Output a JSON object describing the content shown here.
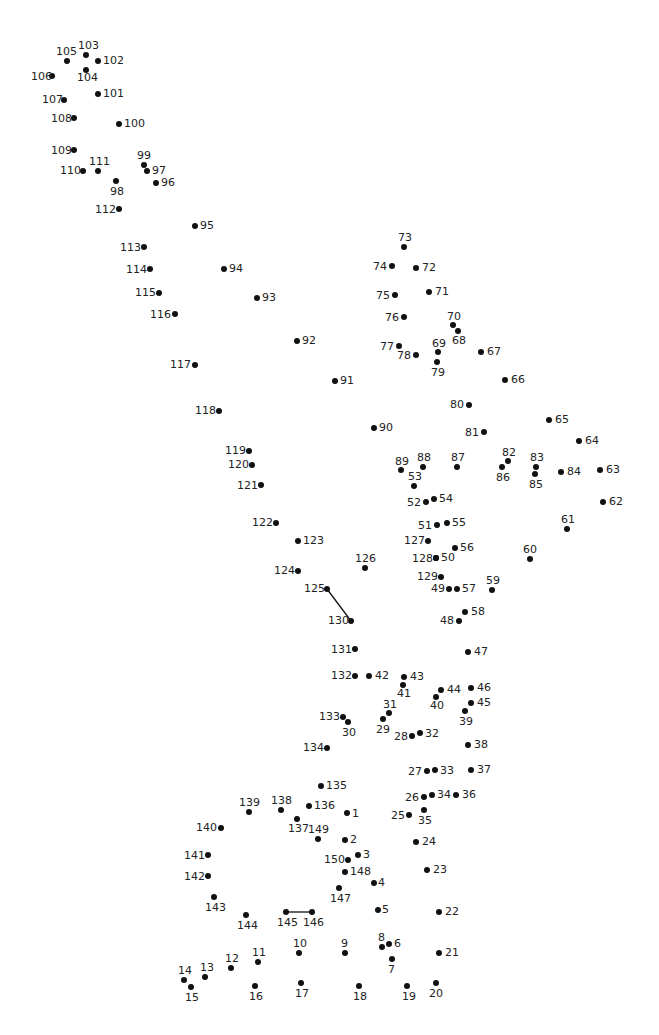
{
  "puzzle": {
    "type": "connect-the-dots",
    "total_dots": 150,
    "colors": {
      "dot": "#111111",
      "label": "#222222",
      "background": "#ffffff"
    },
    "drawn_segments": [
      {
        "from": 125,
        "to": 130
      },
      {
        "from": 145,
        "to": 146
      }
    ],
    "dots": [
      {
        "n": 1,
        "x": 347,
        "y": 813,
        "lx": 352,
        "ly": 808
      },
      {
        "n": 2,
        "x": 345,
        "y": 840,
        "lx": 350,
        "ly": 834
      },
      {
        "n": 3,
        "x": 358,
        "y": 855,
        "lx": 363,
        "ly": 849
      },
      {
        "n": 4,
        "x": 374,
        "y": 883,
        "lx": 378,
        "ly": 877
      },
      {
        "n": 5,
        "x": 378,
        "y": 910,
        "lx": 382,
        "ly": 904
      },
      {
        "n": 6,
        "x": 389,
        "y": 944,
        "lx": 394,
        "ly": 938
      },
      {
        "n": 7,
        "x": 392,
        "y": 959,
        "lx": 388,
        "ly": 964
      },
      {
        "n": 8,
        "x": 382,
        "y": 947,
        "lx": 378,
        "ly": 932
      },
      {
        "n": 9,
        "x": 345,
        "y": 953,
        "lx": 341,
        "ly": 938
      },
      {
        "n": 10,
        "x": 299,
        "y": 953,
        "lx": 293,
        "ly": 938
      },
      {
        "n": 11,
        "x": 258,
        "y": 962,
        "lx": 252,
        "ly": 947
      },
      {
        "n": 12,
        "x": 231,
        "y": 968,
        "lx": 225,
        "ly": 953
      },
      {
        "n": 13,
        "x": 205,
        "y": 977,
        "lx": 200,
        "ly": 962
      },
      {
        "n": 14,
        "x": 184,
        "y": 980,
        "lx": 178,
        "ly": 965
      },
      {
        "n": 15,
        "x": 191,
        "y": 987,
        "lx": 185,
        "ly": 992
      },
      {
        "n": 16,
        "x": 255,
        "y": 986,
        "lx": 249,
        "ly": 991
      },
      {
        "n": 17,
        "x": 301,
        "y": 983,
        "lx": 295,
        "ly": 988
      },
      {
        "n": 18,
        "x": 359,
        "y": 986,
        "lx": 353,
        "ly": 991
      },
      {
        "n": 19,
        "x": 407,
        "y": 986,
        "lx": 402,
        "ly": 991
      },
      {
        "n": 20,
        "x": 436,
        "y": 983,
        "lx": 429,
        "ly": 988
      },
      {
        "n": 21,
        "x": 439,
        "y": 953,
        "lx": 445,
        "ly": 947
      },
      {
        "n": 22,
        "x": 439,
        "y": 912,
        "lx": 445,
        "ly": 906
      },
      {
        "n": 23,
        "x": 427,
        "y": 870,
        "lx": 433,
        "ly": 864
      },
      {
        "n": 24,
        "x": 416,
        "y": 842,
        "lx": 422,
        "ly": 836
      },
      {
        "n": 25,
        "x": 409,
        "y": 815,
        "lx": 391,
        "ly": 810
      },
      {
        "n": 26,
        "x": 424,
        "y": 797,
        "lx": 405,
        "ly": 792
      },
      {
        "n": 27,
        "x": 427,
        "y": 771,
        "lx": 408,
        "ly": 766
      },
      {
        "n": 28,
        "x": 412,
        "y": 736,
        "lx": 394,
        "ly": 731
      },
      {
        "n": 29,
        "x": 383,
        "y": 719,
        "lx": 376,
        "ly": 724
      },
      {
        "n": 30,
        "x": 348,
        "y": 722,
        "lx": 342,
        "ly": 727
      },
      {
        "n": 31,
        "x": 389,
        "y": 713,
        "lx": 383,
        "ly": 699
      },
      {
        "n": 32,
        "x": 420,
        "y": 733,
        "lx": 425,
        "ly": 728
      },
      {
        "n": 33,
        "x": 435,
        "y": 770,
        "lx": 440,
        "ly": 765
      },
      {
        "n": 34,
        "x": 432,
        "y": 795,
        "lx": 437,
        "ly": 789
      },
      {
        "n": 35,
        "x": 424,
        "y": 810,
        "lx": 418,
        "ly": 815
      },
      {
        "n": 36,
        "x": 456,
        "y": 795,
        "lx": 462,
        "ly": 789
      },
      {
        "n": 37,
        "x": 471,
        "y": 770,
        "lx": 477,
        "ly": 764
      },
      {
        "n": 38,
        "x": 468,
        "y": 745,
        "lx": 474,
        "ly": 739
      },
      {
        "n": 39,
        "x": 465,
        "y": 711,
        "lx": 459,
        "ly": 716
      },
      {
        "n": 40,
        "x": 436,
        "y": 697,
        "lx": 430,
        "ly": 700
      },
      {
        "n": 41,
        "x": 403,
        "y": 685,
        "lx": 397,
        "ly": 688
      },
      {
        "n": 42,
        "x": 369,
        "y": 676,
        "lx": 375,
        "ly": 670
      },
      {
        "n": 43,
        "x": 404,
        "y": 677,
        "lx": 410,
        "ly": 671
      },
      {
        "n": 44,
        "x": 441,
        "y": 690,
        "lx": 447,
        "ly": 684
      },
      {
        "n": 45,
        "x": 471,
        "y": 703,
        "lx": 477,
        "ly": 697
      },
      {
        "n": 46,
        "x": 471,
        "y": 688,
        "lx": 477,
        "ly": 682
      },
      {
        "n": 47,
        "x": 468,
        "y": 652,
        "lx": 474,
        "ly": 646
      },
      {
        "n": 48,
        "x": 459,
        "y": 621,
        "lx": 440,
        "ly": 615
      },
      {
        "n": 49,
        "x": 449,
        "y": 589,
        "lx": 431,
        "ly": 583
      },
      {
        "n": 50,
        "x": 436,
        "y": 558,
        "lx": 441,
        "ly": 552
      },
      {
        "n": 51,
        "x": 437,
        "y": 525,
        "lx": 418,
        "ly": 520
      },
      {
        "n": 52,
        "x": 426,
        "y": 502,
        "lx": 407,
        "ly": 497
      },
      {
        "n": 53,
        "x": 414,
        "y": 486,
        "lx": 408,
        "ly": 471
      },
      {
        "n": 54,
        "x": 434,
        "y": 499,
        "lx": 439,
        "ly": 493
      },
      {
        "n": 55,
        "x": 447,
        "y": 523,
        "lx": 452,
        "ly": 517
      },
      {
        "n": 56,
        "x": 455,
        "y": 548,
        "lx": 460,
        "ly": 542
      },
      {
        "n": 57,
        "x": 457,
        "y": 589,
        "lx": 462,
        "ly": 583
      },
      {
        "n": 58,
        "x": 465,
        "y": 612,
        "lx": 471,
        "ly": 606
      },
      {
        "n": 59,
        "x": 492,
        "y": 590,
        "lx": 486,
        "ly": 575
      },
      {
        "n": 60,
        "x": 530,
        "y": 559,
        "lx": 523,
        "ly": 544
      },
      {
        "n": 61,
        "x": 567,
        "y": 529,
        "lx": 561,
        "ly": 514
      },
      {
        "n": 62,
        "x": 603,
        "y": 502,
        "lx": 609,
        "ly": 496
      },
      {
        "n": 63,
        "x": 600,
        "y": 470,
        "lx": 606,
        "ly": 464
      },
      {
        "n": 64,
        "x": 579,
        "y": 441,
        "lx": 585,
        "ly": 435
      },
      {
        "n": 65,
        "x": 549,
        "y": 420,
        "lx": 555,
        "ly": 414
      },
      {
        "n": 66,
        "x": 505,
        "y": 380,
        "lx": 511,
        "ly": 374
      },
      {
        "n": 67,
        "x": 481,
        "y": 352,
        "lx": 487,
        "ly": 346
      },
      {
        "n": 68,
        "x": 458,
        "y": 331,
        "lx": 452,
        "ly": 335
      },
      {
        "n": 69,
        "x": 438,
        "y": 352,
        "lx": 432,
        "ly": 338
      },
      {
        "n": 70,
        "x": 453,
        "y": 325,
        "lx": 447,
        "ly": 311
      },
      {
        "n": 71,
        "x": 429,
        "y": 292,
        "lx": 435,
        "ly": 286
      },
      {
        "n": 72,
        "x": 416,
        "y": 268,
        "lx": 422,
        "ly": 262
      },
      {
        "n": 73,
        "x": 404,
        "y": 247,
        "lx": 398,
        "ly": 232
      },
      {
        "n": 74,
        "x": 392,
        "y": 266,
        "lx": 373,
        "ly": 261
      },
      {
        "n": 75,
        "x": 395,
        "y": 295,
        "lx": 376,
        "ly": 290
      },
      {
        "n": 76,
        "x": 404,
        "y": 317,
        "lx": 385,
        "ly": 312
      },
      {
        "n": 77,
        "x": 399,
        "y": 346,
        "lx": 380,
        "ly": 341
      },
      {
        "n": 78,
        "x": 416,
        "y": 355,
        "lx": 397,
        "ly": 350
      },
      {
        "n": 79,
        "x": 437,
        "y": 362,
        "lx": 431,
        "ly": 367
      },
      {
        "n": 80,
        "x": 469,
        "y": 405,
        "lx": 450,
        "ly": 399
      },
      {
        "n": 81,
        "x": 484,
        "y": 432,
        "lx": 465,
        "ly": 427
      },
      {
        "n": 82,
        "x": 508,
        "y": 461,
        "lx": 502,
        "ly": 447
      },
      {
        "n": 83,
        "x": 536,
        "y": 467,
        "lx": 530,
        "ly": 452
      },
      {
        "n": 84,
        "x": 561,
        "y": 472,
        "lx": 567,
        "ly": 466
      },
      {
        "n": 85,
        "x": 535,
        "y": 474,
        "lx": 529,
        "ly": 479
      },
      {
        "n": 86,
        "x": 502,
        "y": 467,
        "lx": 496,
        "ly": 472
      },
      {
        "n": 87,
        "x": 457,
        "y": 467,
        "lx": 451,
        "ly": 452
      },
      {
        "n": 88,
        "x": 423,
        "y": 467,
        "lx": 417,
        "ly": 452
      },
      {
        "n": 89,
        "x": 401,
        "y": 470,
        "lx": 395,
        "ly": 456
      },
      {
        "n": 90,
        "x": 374,
        "y": 428,
        "lx": 379,
        "ly": 422
      },
      {
        "n": 91,
        "x": 335,
        "y": 381,
        "lx": 340,
        "ly": 375
      },
      {
        "n": 92,
        "x": 297,
        "y": 341,
        "lx": 302,
        "ly": 335
      },
      {
        "n": 93,
        "x": 257,
        "y": 298,
        "lx": 262,
        "ly": 292
      },
      {
        "n": 94,
        "x": 224,
        "y": 269,
        "lx": 229,
        "ly": 263
      },
      {
        "n": 95,
        "x": 195,
        "y": 226,
        "lx": 200,
        "ly": 220
      },
      {
        "n": 96,
        "x": 156,
        "y": 183,
        "lx": 161,
        "ly": 177
      },
      {
        "n": 97,
        "x": 147,
        "y": 171,
        "lx": 152,
        "ly": 165
      },
      {
        "n": 98,
        "x": 116,
        "y": 181,
        "lx": 110,
        "ly": 186
      },
      {
        "n": 99,
        "x": 144,
        "y": 165,
        "lx": 137,
        "ly": 150
      },
      {
        "n": 100,
        "x": 119,
        "y": 124,
        "lx": 124,
        "ly": 118
      },
      {
        "n": 101,
        "x": 98,
        "y": 94,
        "lx": 103,
        "ly": 88
      },
      {
        "n": 102,
        "x": 98,
        "y": 61,
        "lx": 103,
        "ly": 55
      },
      {
        "n": 103,
        "x": 86,
        "y": 55,
        "lx": 78,
        "ly": 40
      },
      {
        "n": 104,
        "x": 86,
        "y": 70,
        "lx": 77,
        "ly": 72
      },
      {
        "n": 105,
        "x": 67,
        "y": 61,
        "lx": 56,
        "ly": 46
      },
      {
        "n": 106,
        "x": 52,
        "y": 76,
        "lx": 31,
        "ly": 71
      },
      {
        "n": 107,
        "x": 64,
        "y": 100,
        "lx": 42,
        "ly": 94
      },
      {
        "n": 108,
        "x": 74,
        "y": 118,
        "lx": 51,
        "ly": 113
      },
      {
        "n": 109,
        "x": 74,
        "y": 150,
        "lx": 51,
        "ly": 145
      },
      {
        "n": 110,
        "x": 83,
        "y": 171,
        "lx": 60,
        "ly": 165
      },
      {
        "n": 111,
        "x": 98,
        "y": 171,
        "lx": 89,
        "ly": 156
      },
      {
        "n": 112,
        "x": 119,
        "y": 209,
        "lx": 95,
        "ly": 204
      },
      {
        "n": 113,
        "x": 144,
        "y": 247,
        "lx": 120,
        "ly": 242
      },
      {
        "n": 114,
        "x": 150,
        "y": 269,
        "lx": 126,
        "ly": 264
      },
      {
        "n": 115,
        "x": 159,
        "y": 293,
        "lx": 135,
        "ly": 287
      },
      {
        "n": 116,
        "x": 175,
        "y": 314,
        "lx": 150,
        "ly": 309
      },
      {
        "n": 117,
        "x": 195,
        "y": 365,
        "lx": 170,
        "ly": 359
      },
      {
        "n": 118,
        "x": 219,
        "y": 411,
        "lx": 195,
        "ly": 405
      },
      {
        "n": 119,
        "x": 249,
        "y": 451,
        "lx": 225,
        "ly": 445
      },
      {
        "n": 120,
        "x": 252,
        "y": 465,
        "lx": 228,
        "ly": 459
      },
      {
        "n": 121,
        "x": 261,
        "y": 485,
        "lx": 237,
        "ly": 480
      },
      {
        "n": 122,
        "x": 276,
        "y": 523,
        "lx": 252,
        "ly": 517
      },
      {
        "n": 123,
        "x": 298,
        "y": 541,
        "lx": 303,
        "ly": 535
      },
      {
        "n": 124,
        "x": 298,
        "y": 571,
        "lx": 274,
        "ly": 565
      },
      {
        "n": 125,
        "x": 327,
        "y": 589,
        "lx": 304,
        "ly": 583
      },
      {
        "n": 126,
        "x": 365,
        "y": 568,
        "lx": 355,
        "ly": 553
      },
      {
        "n": 127,
        "x": 428,
        "y": 541,
        "lx": 404,
        "ly": 535
      },
      {
        "n": 128,
        "x": 436,
        "y": 558,
        "lx": 412,
        "ly": 553
      },
      {
        "n": 129,
        "x": 441,
        "y": 577,
        "lx": 417,
        "ly": 571
      },
      {
        "n": 130,
        "x": 351,
        "y": 621,
        "lx": 328,
        "ly": 615
      },
      {
        "n": 131,
        "x": 355,
        "y": 649,
        "lx": 331,
        "ly": 644
      },
      {
        "n": 132,
        "x": 355,
        "y": 676,
        "lx": 331,
        "ly": 670
      },
      {
        "n": 133,
        "x": 343,
        "y": 717,
        "lx": 319,
        "ly": 711
      },
      {
        "n": 134,
        "x": 327,
        "y": 748,
        "lx": 303,
        "ly": 742
      },
      {
        "n": 135,
        "x": 321,
        "y": 786,
        "lx": 326,
        "ly": 780
      },
      {
        "n": 136,
        "x": 309,
        "y": 806,
        "lx": 314,
        "ly": 800
      },
      {
        "n": 137,
        "x": 297,
        "y": 819,
        "lx": 288,
        "ly": 823
      },
      {
        "n": 138,
        "x": 281,
        "y": 810,
        "lx": 271,
        "ly": 795
      },
      {
        "n": 139,
        "x": 249,
        "y": 812,
        "lx": 239,
        "ly": 797
      },
      {
        "n": 140,
        "x": 221,
        "y": 828,
        "lx": 196,
        "ly": 822
      },
      {
        "n": 141,
        "x": 208,
        "y": 855,
        "lx": 184,
        "ly": 850
      },
      {
        "n": 142,
        "x": 208,
        "y": 876,
        "lx": 184,
        "ly": 871
      },
      {
        "n": 143,
        "x": 214,
        "y": 897,
        "lx": 205,
        "ly": 902
      },
      {
        "n": 144,
        "x": 246,
        "y": 915,
        "lx": 237,
        "ly": 920
      },
      {
        "n": 145,
        "x": 286,
        "y": 912,
        "lx": 277,
        "ly": 917
      },
      {
        "n": 146,
        "x": 312,
        "y": 912,
        "lx": 303,
        "ly": 917
      },
      {
        "n": 147,
        "x": 339,
        "y": 888,
        "lx": 330,
        "ly": 893
      },
      {
        "n": 148,
        "x": 345,
        "y": 872,
        "lx": 350,
        "ly": 866
      },
      {
        "n": 149,
        "x": 318,
        "y": 839,
        "lx": 308,
        "ly": 824
      },
      {
        "n": 150,
        "x": 348,
        "y": 860,
        "lx": 324,
        "ly": 854
      }
    ]
  }
}
